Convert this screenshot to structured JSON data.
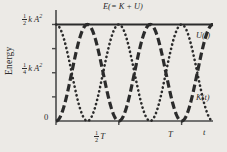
{
  "figure": {
    "background_color": "#eceae6",
    "ink_color": "#2b2b2b",
    "axis_title_y": "Energy",
    "axis_name_x": "t"
  },
  "labels": {
    "total_energy": "E(= K + U)",
    "potential_curve": "U(t)",
    "kinetic_curve": "K(t)",
    "y_tick_half_numerator": "1",
    "y_tick_half_denominator": "2",
    "y_tick_half_rest": "k A",
    "y_tick_half_exp": "2",
    "y_tick_quarter_numerator": "1",
    "y_tick_quarter_denominator": "4",
    "y_tick_quarter_rest": "k A",
    "y_tick_quarter_exp": "2",
    "y_tick_zero": "0",
    "x_tick_halfT_numerator": "1",
    "x_tick_halfT_denominator": "2",
    "x_tick_halfT_rest": "T",
    "x_tick_T": "T"
  },
  "chart_data": {
    "type": "line",
    "title": "",
    "xlabel": "t",
    "ylabel": "Energy",
    "xlim": [
      0,
      1.25
    ],
    "ylim": [
      0,
      0.575
    ],
    "grid": false,
    "legend_position": "inline-right",
    "x_ticks": [
      {
        "value": 0,
        "label": "0"
      },
      {
        "value": 0.5,
        "label": "1/2 T"
      },
      {
        "value": 1.0,
        "label": "T"
      }
    ],
    "y_ticks": [
      {
        "value": 0,
        "label": "0"
      },
      {
        "value": 0.125,
        "label": ""
      },
      {
        "value": 0.25,
        "label": "1/4 k A^2"
      },
      {
        "value": 0.375,
        "label": ""
      },
      {
        "value": 0.5,
        "label": "1/2 k A^2"
      }
    ],
    "annotations": [
      {
        "text": "E(= K + U)",
        "x": 0.5,
        "y": 0.5
      },
      {
        "text": "U(t)",
        "x": 1.13,
        "y": 0.37
      },
      {
        "text": "K(t)",
        "x": 1.13,
        "y": 0.13
      }
    ],
    "series": [
      {
        "name": "E(= K + U)",
        "style": "solid",
        "linewidth": 2.2,
        "description": "Constant total energy at 1/2 k A^2",
        "formula": "E = 0.5*k*A^2",
        "value": 0.5
      },
      {
        "name": "K(t)",
        "style": "dashed",
        "linewidth": 3.2,
        "description": "Kinetic energy, starts at 0, period T/2",
        "formula": "K = 0.5*k*A^2 * sin^2(2*pi*t/T)",
        "amplitude": 0.5,
        "period": 0.5,
        "phase": 0
      },
      {
        "name": "U(t)",
        "style": "dotted",
        "linewidth": 2.6,
        "description": "Potential energy, starts at max, period T/2",
        "formula": "U = 0.5*k*A^2 * cos^2(2*pi*t/T)",
        "amplitude": 0.5,
        "period": 0.5,
        "phase": 0.25
      }
    ]
  }
}
